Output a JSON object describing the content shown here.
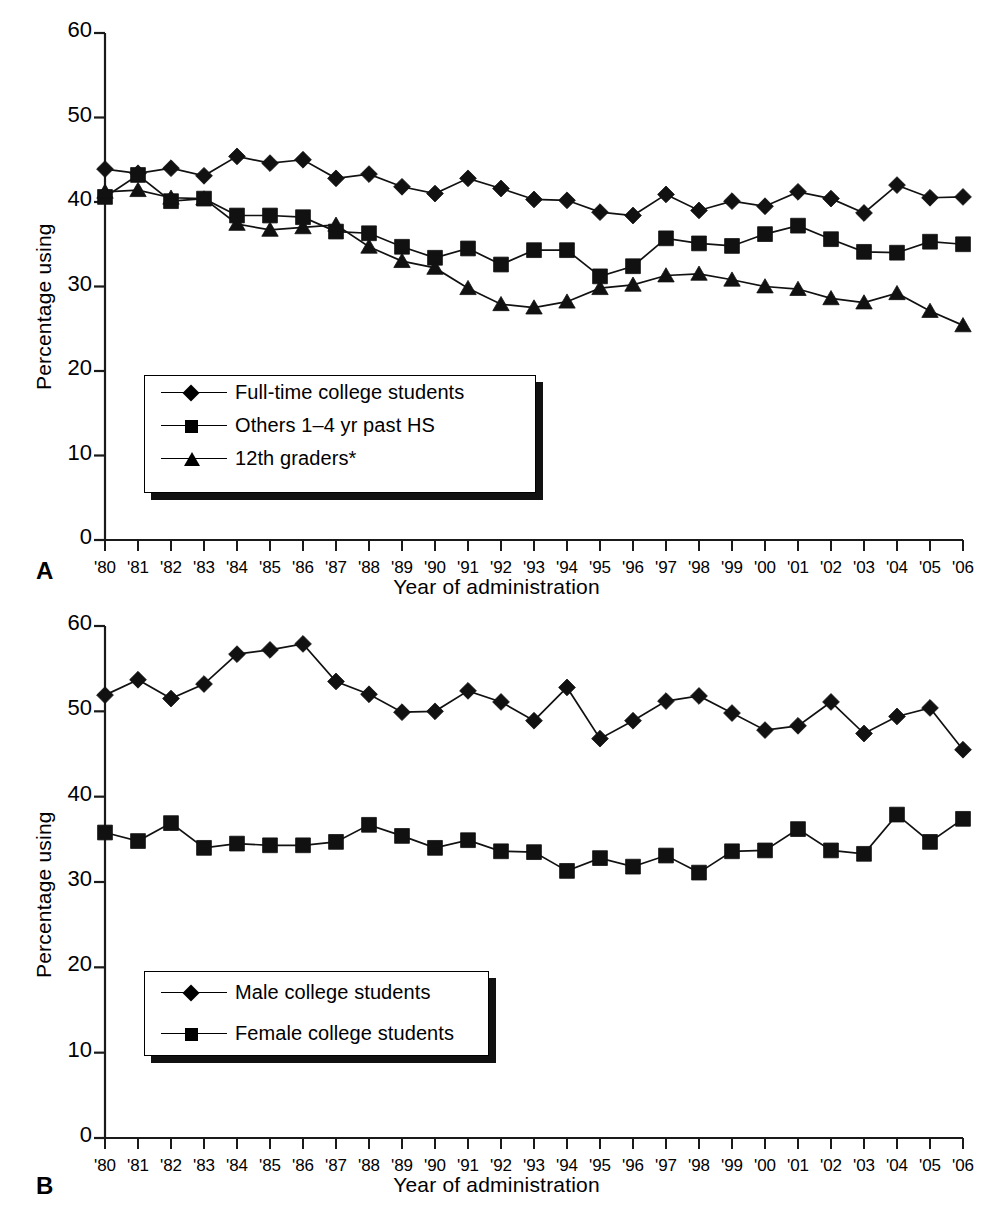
{
  "figure": {
    "panels": [
      {
        "letter": "A",
        "axis": {
          "ylabel": "Percentage using",
          "xlabel": "Year of administration",
          "yticks": [
            "0",
            "10",
            "20",
            "30",
            "40",
            "50",
            "60"
          ],
          "xticks": [
            "'80",
            "'81",
            "'82",
            "'83",
            "'84",
            "'85",
            "'86",
            "'87",
            "'88",
            "'89",
            "'90",
            "'91",
            "'92",
            "'93",
            "'94",
            "'95",
            "'96",
            "'97",
            "'98",
            "'99",
            "'00",
            "'01",
            "'02",
            "'03",
            "'04",
            "'05",
            "'06"
          ]
        },
        "legend": [
          {
            "label": "Full-time college students",
            "marker": "diamond"
          },
          {
            "label": "Others 1–4 yr past HS",
            "marker": "square"
          },
          {
            "label": "12th graders*",
            "marker": "triangle"
          }
        ]
      },
      {
        "letter": "B",
        "axis": {
          "ylabel": "Percentage using",
          "xlabel": "Year of administration",
          "yticks": [
            "0",
            "10",
            "20",
            "30",
            "40",
            "50",
            "60"
          ],
          "xticks": [
            "'80",
            "'81",
            "'82",
            "'83",
            "'84",
            "'85",
            "'86",
            "'87",
            "'88",
            "'89",
            "'90",
            "'91",
            "'92",
            "'93",
            "'94",
            "'95",
            "'96",
            "'97",
            "'98",
            "'99",
            "'00",
            "'01",
            "'02",
            "'03",
            "'04",
            "'05",
            "'06"
          ]
        },
        "legend": [
          {
            "label": "Male college students",
            "marker": "diamond"
          },
          {
            "label": "Female college students",
            "marker": "square"
          }
        ]
      }
    ],
    "caption_fragment": ""
  },
  "chart_data": [
    {
      "type": "line",
      "panel": "A",
      "title": "",
      "xlabel": "Year of administration",
      "ylabel": "Percentage using",
      "ylim": [
        0,
        60
      ],
      "ytick_step": 10,
      "grid": false,
      "legend_position": "inside-lower-left",
      "categories": [
        "'80",
        "'81",
        "'82",
        "'83",
        "'84",
        "'85",
        "'86",
        "'87",
        "'88",
        "'89",
        "'90",
        "'91",
        "'92",
        "'93",
        "'94",
        "'95",
        "'96",
        "'97",
        "'98",
        "'99",
        "'00",
        "'01",
        "'02",
        "'03",
        "'04",
        "'05",
        "'06"
      ],
      "series": [
        {
          "name": "Full-time college students",
          "marker": "diamond",
          "values": [
            43.9,
            43.4,
            44.0,
            43.1,
            45.4,
            44.6,
            45.0,
            42.8,
            43.3,
            41.8,
            41.0,
            42.8,
            41.6,
            40.3,
            40.2,
            38.8,
            38.4,
            40.9,
            39.0,
            40.1,
            39.5,
            41.2,
            40.4,
            38.7,
            42.0,
            40.5,
            40.6
          ]
        },
        {
          "name": "Others 1–4 yr past HS",
          "marker": "square",
          "values": [
            40.6,
            43.2,
            40.1,
            40.4,
            38.4,
            38.4,
            38.2,
            36.5,
            36.3,
            34.7,
            33.4,
            34.5,
            32.6,
            34.3,
            34.3,
            31.2,
            32.4,
            35.7,
            35.1,
            34.8,
            36.2,
            37.2,
            35.6,
            34.1,
            34.0,
            35.3,
            35.0
          ]
        },
        {
          "name": "12th graders*",
          "marker": "triangle",
          "values": [
            41.2,
            41.4,
            40.5,
            40.4,
            37.4,
            36.7,
            37.0,
            37.3,
            34.7,
            33.0,
            32.2,
            29.8,
            27.9,
            27.5,
            28.2,
            29.8,
            30.2,
            31.3,
            31.5,
            30.8,
            30.0,
            29.7,
            28.6,
            28.1,
            29.2,
            27.1,
            25.4
          ]
        }
      ]
    },
    {
      "type": "line",
      "panel": "B",
      "title": "",
      "xlabel": "Year of administration",
      "ylabel": "Percentage using",
      "ylim": [
        0,
        60
      ],
      "ytick_step": 10,
      "grid": false,
      "legend_position": "inside-lower-left",
      "categories": [
        "'80",
        "'81",
        "'82",
        "'83",
        "'84",
        "'85",
        "'86",
        "'87",
        "'88",
        "'89",
        "'90",
        "'91",
        "'92",
        "'93",
        "'94",
        "'95",
        "'96",
        "'97",
        "'98",
        "'99",
        "'00",
        "'01",
        "'02",
        "'03",
        "'04",
        "'05",
        "'06"
      ],
      "series": [
        {
          "name": "Male college students",
          "marker": "diamond",
          "values": [
            51.9,
            53.7,
            51.5,
            53.2,
            56.7,
            57.2,
            57.9,
            53.5,
            52.0,
            49.9,
            50.0,
            52.4,
            51.1,
            48.9,
            52.8,
            46.8,
            48.9,
            51.2,
            51.8,
            49.8,
            47.8,
            48.3,
            51.1,
            47.4,
            49.4,
            50.4,
            45.5
          ]
        },
        {
          "name": "Female college students",
          "marker": "square",
          "values": [
            35.8,
            34.8,
            36.9,
            34.0,
            34.5,
            34.3,
            34.3,
            34.7,
            36.7,
            35.4,
            34.0,
            34.9,
            33.6,
            33.5,
            31.3,
            32.8,
            31.8,
            33.1,
            31.1,
            33.6,
            33.7,
            36.2,
            33.7,
            33.3,
            37.9,
            34.7,
            37.4
          ]
        }
      ]
    }
  ]
}
